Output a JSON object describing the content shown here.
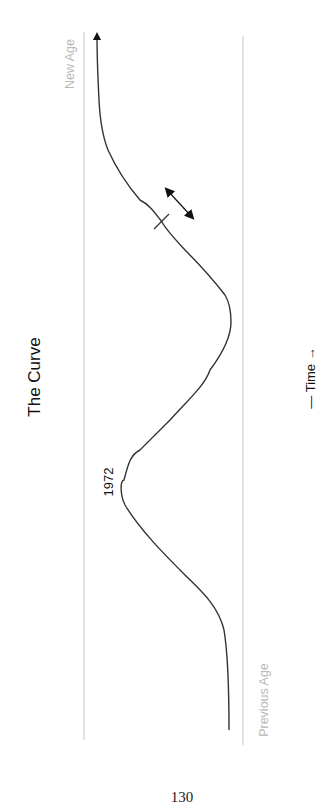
{
  "diagram": {
    "title": "The Curve",
    "labels": {
      "new_age": "New Age",
      "previous_age": "Previous Age",
      "peak_year": "1972",
      "time_axis": "— Time —"
    },
    "page_number": "130",
    "orientation": "rotated 90° counter-clockwise",
    "colors": {
      "curve": "#333333",
      "guide_lines": "#cfcfcf",
      "era_labels": "#b8b8b8",
      "text": "#111111"
    },
    "elements": {
      "guide_line_new_age": "vertical boundary line on the New Age side",
      "guide_line_previous_age": "vertical boundary line on the Previous Age side",
      "curve": "S-shaped wave starting at Previous Age, dipping at 1972, rising to New Age with arrowhead",
      "double_arrow": "two-headed arrow beside the curve indicating movement",
      "tick_mark": "short tick crossing the curve near the double arrow"
    }
  }
}
